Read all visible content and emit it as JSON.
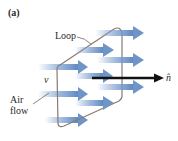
{
  "figure": {
    "panel_label": "(a)",
    "labels": {
      "loop": "Loop",
      "velocity": "v⃗",
      "air_flow_line1": "Air",
      "air_flow_line2": "flow",
      "normal": "n̂"
    },
    "colors": {
      "arrow_flow": "#6f95c8",
      "loop_frame": "#8a7a72",
      "normal_vector": "#111111",
      "text": "#2a2a2a"
    },
    "flow_arrows": [
      {
        "x1": 95,
        "x2": 143,
        "y": 33
      },
      {
        "x1": 75,
        "x2": 113,
        "y": 50
      },
      {
        "x1": 97,
        "x2": 143,
        "y": 60
      },
      {
        "x1": 38,
        "x2": 87,
        "y": 67
      },
      {
        "x1": 75,
        "x2": 100,
        "y": 76
      },
      {
        "x1": 97,
        "x2": 143,
        "y": 87
      },
      {
        "x1": 38,
        "x2": 87,
        "y": 94
      },
      {
        "x1": 75,
        "x2": 113,
        "y": 103
      },
      {
        "x1": 45,
        "x2": 87,
        "y": 120
      }
    ]
  }
}
